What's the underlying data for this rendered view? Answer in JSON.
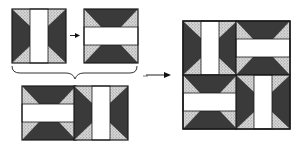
{
  "diagram": {
    "colors": {
      "dark": "#3a3a3a",
      "stipple_bg": "#d9d9d9",
      "stipple_dot": "#7a7a7a",
      "bar": "#ffffff",
      "outline": "#1a1a1a"
    },
    "steps": [
      {
        "id": "block-vertical",
        "label": "Block with vertical white bar"
      },
      {
        "id": "block-horizontal",
        "label": "Block rotated 90° with horizontal white bar"
      },
      {
        "id": "row",
        "label": "Two blocks joined into a row"
      },
      {
        "id": "final",
        "label": "Four blocks assembled into finished square"
      }
    ],
    "arrows": [
      {
        "from": "block-vertical",
        "to": "block-horizontal",
        "label": "rotate"
      },
      {
        "from": "row",
        "to": "final",
        "label": "assemble"
      }
    ],
    "brace": {
      "groups": [
        "block-vertical",
        "block-horizontal"
      ],
      "result": "row"
    }
  }
}
